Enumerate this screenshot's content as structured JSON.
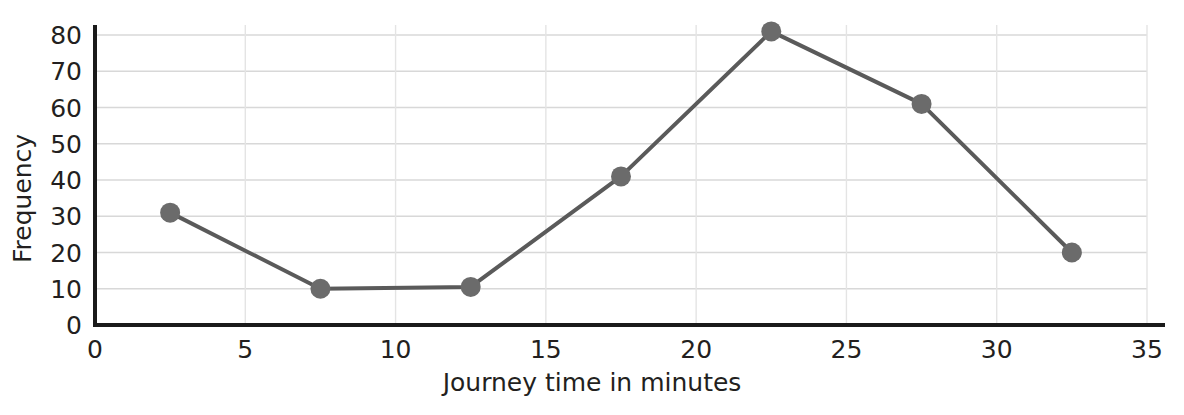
{
  "chart_data": {
    "type": "line",
    "title": "",
    "xlabel": "Journey time in minutes",
    "ylabel": "Frequency",
    "x": [
      2.5,
      7.5,
      12.5,
      17.5,
      22.5,
      27.5,
      32.5
    ],
    "values": [
      31,
      10,
      10.5,
      41,
      81,
      61,
      20
    ],
    "series": [
      {
        "name": "Frequency",
        "x": [
          2.5,
          7.5,
          12.5,
          17.5,
          22.5,
          27.5,
          32.5
        ],
        "values": [
          31,
          10,
          10.5,
          41,
          81,
          61,
          20
        ]
      }
    ],
    "xlim": [
      0,
      35
    ],
    "ylim": [
      0,
      80
    ],
    "xticks": [
      "0",
      "5",
      "10",
      "15",
      "20",
      "25",
      "30",
      "35"
    ],
    "xtick_values": [
      0,
      5,
      10,
      15,
      20,
      25,
      30,
      35
    ],
    "yticks": [
      "0",
      "10",
      "20",
      "30",
      "40",
      "50",
      "60",
      "70",
      "80"
    ],
    "ytick_values": [
      0,
      10,
      20,
      30,
      40,
      50,
      60,
      70,
      80
    ],
    "grid": true,
    "grid_horizontal": true,
    "grid_vertical": true,
    "legend": "none",
    "marker": "circle",
    "colors": {
      "line": "#5a5a5a",
      "marker": "#6b6b6b",
      "axis": "#1a1a1a",
      "grid_horizontal": "#d8d8d8",
      "grid_vertical": "#e4e4e4",
      "text": "#231f20",
      "background": "#ffffff"
    }
  }
}
